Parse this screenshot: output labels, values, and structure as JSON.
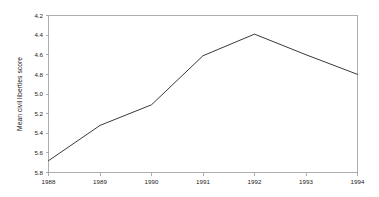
{
  "chart_data": {
    "type": "line",
    "title": "",
    "subtitle": "",
    "xlabel": "",
    "ylabel": "Mean civil liberties score",
    "x": [
      1988,
      1989,
      1990,
      1991,
      1992,
      1993,
      1994
    ],
    "categories": [
      "1988",
      "1989",
      "1990",
      "1991",
      "1992",
      "1993",
      "1994"
    ],
    "values": [
      5.68,
      5.32,
      5.11,
      4.61,
      4.39,
      4.6,
      4.8
    ],
    "series": [
      {
        "name": "Mean civil liberties score",
        "values": [
          5.68,
          5.32,
          5.11,
          4.61,
          4.39,
          4.6,
          4.8
        ]
      }
    ],
    "xlim": [
      1988,
      1994
    ],
    "ylim": [
      5.8,
      4.2
    ],
    "y_axis_inverted": true,
    "xticks": [
      "1988",
      "1989",
      "1990",
      "1991",
      "1992",
      "1993",
      "1994"
    ],
    "yticks": [
      "4.2",
      "4.4",
      "4.6",
      "4.8",
      "5.0",
      "5.2",
      "5.4",
      "5.6",
      "5.8"
    ],
    "ytick_values": [
      4.2,
      4.4,
      4.6,
      4.8,
      5.0,
      5.2,
      5.4,
      5.6,
      5.8
    ],
    "grid": false,
    "legend": null,
    "legend_position": "none",
    "annotations": [],
    "line_color": "#3a3a3a",
    "frame_color": "#9a9a9a",
    "background_color": "#ffffff"
  },
  "axes": {
    "y_title": "Mean civil liberties score",
    "x_title": "",
    "ytick_0": "4.2",
    "ytick_1": "4.4",
    "ytick_2": "4.6",
    "ytick_3": "4.8",
    "ytick_4": "5.0",
    "ytick_5": "5.2",
    "ytick_6": "5.4",
    "ytick_7": "5.6",
    "ytick_8": "5.8",
    "xtick_0": "1988",
    "xtick_1": "1989",
    "xtick_2": "1990",
    "xtick_3": "1991",
    "xtick_4": "1992",
    "xtick_5": "1993",
    "xtick_6": "1994"
  }
}
